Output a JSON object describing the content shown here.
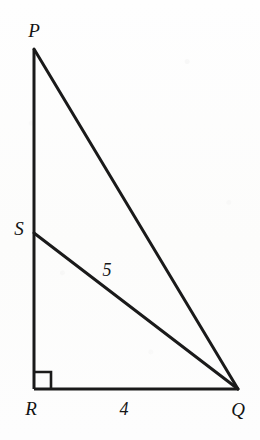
{
  "figure": {
    "background_color": "#fdfdfc",
    "stroke_color": "#1a1a1a",
    "canvas": {
      "width": 260,
      "height": 440
    },
    "vertices": [
      {
        "name": "P",
        "label": "P",
        "x": 34,
        "y": 49,
        "label_x": 34,
        "label_y": 30
      },
      {
        "name": "S",
        "label": "S",
        "x": 34,
        "y": 233,
        "label_x": 19,
        "label_y": 228
      },
      {
        "name": "R",
        "label": "R",
        "x": 34,
        "y": 389,
        "label_x": 31,
        "label_y": 408
      },
      {
        "name": "Q",
        "label": "Q",
        "x": 238,
        "y": 389,
        "label_x": 238,
        "label_y": 409
      }
    ],
    "segments": [
      {
        "name": "PR",
        "from": "P",
        "to": "R",
        "x1": 34,
        "y1": 49,
        "x2": 34,
        "y2": 389,
        "width": 3.0
      },
      {
        "name": "PQ",
        "from": "P",
        "to": "Q",
        "x1": 34,
        "y1": 49,
        "x2": 238,
        "y2": 389,
        "width": 3.0
      },
      {
        "name": "SQ",
        "from": "S",
        "to": "Q",
        "x1": 34,
        "y1": 233,
        "x2": 238,
        "y2": 389,
        "width": 3.0
      },
      {
        "name": "RQ",
        "from": "R",
        "to": "Q",
        "x1": 34,
        "y1": 389,
        "x2": 238,
        "y2": 389,
        "width": 2.8
      }
    ],
    "right_angle": {
      "at_vertex": "R",
      "size": 17,
      "x": 34,
      "y": 389,
      "stroke_width": 2.6
    },
    "measure_labels": [
      {
        "name": "SQ-length",
        "label": "5",
        "segment": "SQ",
        "x": 107,
        "y": 270
      },
      {
        "name": "RQ-length",
        "label": "4",
        "segment": "RQ",
        "x": 124,
        "y": 409
      }
    ]
  }
}
